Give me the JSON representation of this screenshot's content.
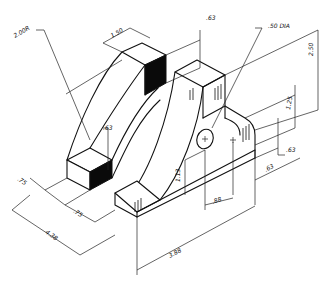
{
  "drawing": {
    "type": "isometric-dimensioned-drawing",
    "dimensions": {
      "radius_outer": "2.00R",
      "top_width": "1.50",
      "top_thickness": ".63",
      "hole": ".50 DIA",
      "overall_height": "2.50",
      "step_height": "1.25",
      "right_step": ".63",
      "right_offset": ".63",
      "hole_center_height": "1.13",
      "hole_spacing": ".88",
      "inner_radius_gap": ".63",
      "left_depth": ".75",
      "slot_width": ".75",
      "overall_depth": "4.38",
      "overall_length": "3.88"
    }
  }
}
